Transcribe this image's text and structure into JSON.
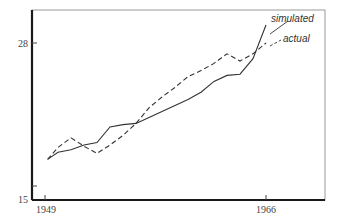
{
  "chart_data": {
    "type": "line",
    "title": "",
    "xlabel": "",
    "ylabel": "",
    "xlim": [
      1949,
      1966
    ],
    "ylim": [
      15,
      28
    ],
    "x_ticks": [
      1949,
      1966
    ],
    "y_ticks": [
      15,
      28
    ],
    "grid": false,
    "legend_position": "annotations (upper right, with leader lines)",
    "x": [
      1949.2,
      1950,
      1951,
      1952,
      1953,
      1954,
      1955,
      1956,
      1957,
      1958,
      1959,
      1960,
      1961,
      1962,
      1963,
      1964,
      1965,
      1966
    ],
    "series": [
      {
        "name": "simulated",
        "style": "solid",
        "values": [
          18.3,
          18.9,
          19.1,
          19.5,
          19.7,
          21.0,
          21.2,
          21.3,
          21.8,
          22.3,
          22.8,
          23.3,
          23.9,
          24.8,
          25.3,
          25.4,
          26.7,
          29.5
        ]
      },
      {
        "name": "actual",
        "style": "dashed",
        "values": [
          18.3,
          19.3,
          20.1,
          19.4,
          18.8,
          19.5,
          20.3,
          21.3,
          22.6,
          23.5,
          24.3,
          25.2,
          25.7,
          26.3,
          27.1,
          26.5,
          27.1,
          28.0
        ]
      }
    ],
    "annotations": [
      {
        "text": "simulated",
        "points_to": "simulated line end"
      },
      {
        "text": "actual",
        "points_to": "actual line end"
      }
    ]
  },
  "axis": {
    "y_tick_top": "28",
    "y_tick_bottom": "15",
    "x_tick_left": "1949",
    "x_tick_right": "1966"
  },
  "legend": {
    "simulated": "simulated",
    "actual": "actual"
  },
  "colors": {
    "line": "#333333",
    "axis": "#1a1a1a",
    "frame": "#888888"
  }
}
